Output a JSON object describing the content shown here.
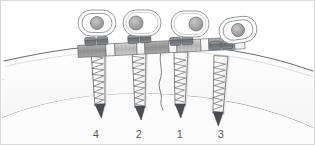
{
  "figure": {
    "type": "medical-illustration",
    "canvas": {
      "width": 315,
      "height": 145
    },
    "border": {
      "visible": true,
      "color": "#d9d9d9"
    },
    "background_color": "#ffffff"
  },
  "colors": {
    "outline": "#5b5f63",
    "bone_outline": "#8d9195",
    "bone_fill": "#fbfbfb",
    "soft_tissue": "#f1f1f1",
    "plate_light": "#ffffff",
    "plate_mid": "#c9c9c9",
    "plate_dark": "#8f8f8f",
    "screw_head": "#6f7377",
    "screw_body": "#f7f7f7",
    "screw_tip": "#4a4e52",
    "label_text": "#5a5a5a"
  },
  "screws": [
    {
      "id": "screw-4",
      "label": "4",
      "order": 4,
      "x": 99,
      "label_x": 96,
      "label_y": 135,
      "tilt_deg": -2,
      "length": 62,
      "threads": 10,
      "head_seat_x": 97,
      "head_seat_y": 48
    },
    {
      "id": "screw-2",
      "label": "2",
      "order": 2,
      "x": 140,
      "label_x": 139,
      "label_y": 135,
      "tilt_deg": -1,
      "length": 64,
      "threads": 10,
      "head_seat_x": 139,
      "head_seat_y": 48
    },
    {
      "id": "screw-1",
      "label": "1",
      "order": 1,
      "x": 182,
      "label_x": 180,
      "label_y": 135,
      "tilt_deg": 1,
      "length": 60,
      "threads": 10,
      "head_seat_x": 181,
      "head_seat_y": 50
    },
    {
      "id": "screw-3",
      "label": "3",
      "order": 3,
      "x": 222,
      "label_x": 221,
      "label_y": 135,
      "tilt_deg": 3,
      "length": 64,
      "threads": 10,
      "head_seat_x": 219,
      "head_seat_y": 54
    }
  ],
  "screw_head_views": [
    {
      "id": "head-view-4",
      "for_screw": "4",
      "cx": 97,
      "cy": 23,
      "rx": 19,
      "ry": 13,
      "rings": 2,
      "inner_offset_x": 0,
      "inner_offset_y": 0,
      "alignment": "centered",
      "rotation_deg": 0
    },
    {
      "id": "head-view-2",
      "for_screw": "2",
      "cx": 142,
      "cy": 23,
      "rx": 19,
      "ry": 13,
      "rings": 1,
      "inner_offset_x": -6,
      "inner_offset_y": 0,
      "alignment": "offset-left",
      "rotation_deg": 0
    },
    {
      "id": "head-view-1",
      "for_screw": "1",
      "cx": 190,
      "cy": 24,
      "rx": 19,
      "ry": 13,
      "rings": 1,
      "inner_offset_x": 6,
      "inner_offset_y": 0,
      "alignment": "offset-right",
      "rotation_deg": 0
    },
    {
      "id": "head-view-3",
      "for_screw": "3",
      "cx": 238,
      "cy": 30,
      "rx": 19,
      "ry": 13,
      "rings": 2,
      "inner_offset_x": 0,
      "inner_offset_y": 0,
      "alignment": "centered",
      "rotation_deg": -8
    }
  ],
  "plate": {
    "id": "bone-plate",
    "description": "Segmented metal fixation plate spanning the four screw heads",
    "start_x": 78,
    "end_x": 250,
    "segments": [
      {
        "x": 78,
        "w": 28,
        "shade": "dark"
      },
      {
        "x": 106,
        "w": 9,
        "shade": "light"
      },
      {
        "x": 115,
        "w": 22,
        "shade": "mid"
      },
      {
        "x": 137,
        "w": 8,
        "shade": "light"
      },
      {
        "x": 145,
        "w": 24,
        "shade": "dark"
      },
      {
        "x": 169,
        "w": 8,
        "shade": "light"
      },
      {
        "x": 177,
        "w": 24,
        "shade": "mid"
      },
      {
        "x": 201,
        "w": 8,
        "shade": "light"
      },
      {
        "x": 209,
        "w": 26,
        "shade": "dark"
      },
      {
        "x": 235,
        "w": 10,
        "shade": "light"
      }
    ]
  },
  "fracture_line": {
    "id": "fracture",
    "description": "Wavy fracture line between screw 2 and screw 1",
    "visible": true,
    "top_x": 161,
    "bottom_x": 163
  },
  "labels": {
    "caption": "",
    "sequence_note": "",
    "items": [
      "4",
      "2",
      "1",
      "3"
    ]
  }
}
